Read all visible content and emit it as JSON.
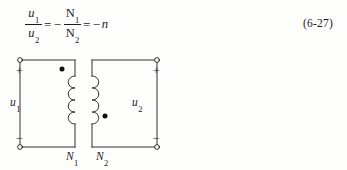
{
  "equation": {
    "lhs": {
      "numerator": "u",
      "numerator_sub": "1",
      "denominator": "u",
      "denominator_sub": "2"
    },
    "equals_1": "=",
    "minus_1": "−",
    "rhs_fraction": {
      "numerator": "N",
      "numerator_sub": "1",
      "denominator": "N",
      "denominator_sub": "2"
    },
    "equals_2": "=",
    "minus_2": "−",
    "result": "n",
    "number": "(6-27)",
    "plain_text": "u1/u2 = -N1/N2 = -n"
  },
  "circuit": {
    "type": "ideal-transformer",
    "primary": {
      "winding_label": "N",
      "winding_label_sub": "1",
      "voltage_label": "u",
      "voltage_label_sub": "1",
      "terminal_top_sign": "+",
      "terminal_bottom_sign": "−",
      "dot_position": "top"
    },
    "secondary": {
      "winding_label": "N",
      "winding_label_sub": "2",
      "voltage_label": "u",
      "voltage_label_sub": "2",
      "terminal_top_sign": "+",
      "terminal_bottom_sign": "−",
      "dot_position": "bottom"
    },
    "colors": {
      "line": "#1b1b1b",
      "background": "#fdfdfc",
      "dot": "#101010"
    }
  }
}
